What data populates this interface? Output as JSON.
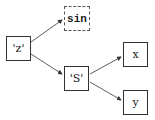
{
  "diagram": {
    "nodes": [
      {
        "id": "z",
        "label": "'z'",
        "style": "solid"
      },
      {
        "id": "sin",
        "label": "sin",
        "style": "dashed"
      },
      {
        "id": "S",
        "label": "'S'",
        "style": "solid"
      },
      {
        "id": "x",
        "label": "x",
        "style": "solid"
      },
      {
        "id": "y",
        "label": "y",
        "style": "solid"
      }
    ],
    "edges": [
      {
        "from": "z",
        "to": "sin"
      },
      {
        "from": "z",
        "to": "S"
      },
      {
        "from": "S",
        "to": "x"
      },
      {
        "from": "S",
        "to": "y"
      }
    ]
  }
}
